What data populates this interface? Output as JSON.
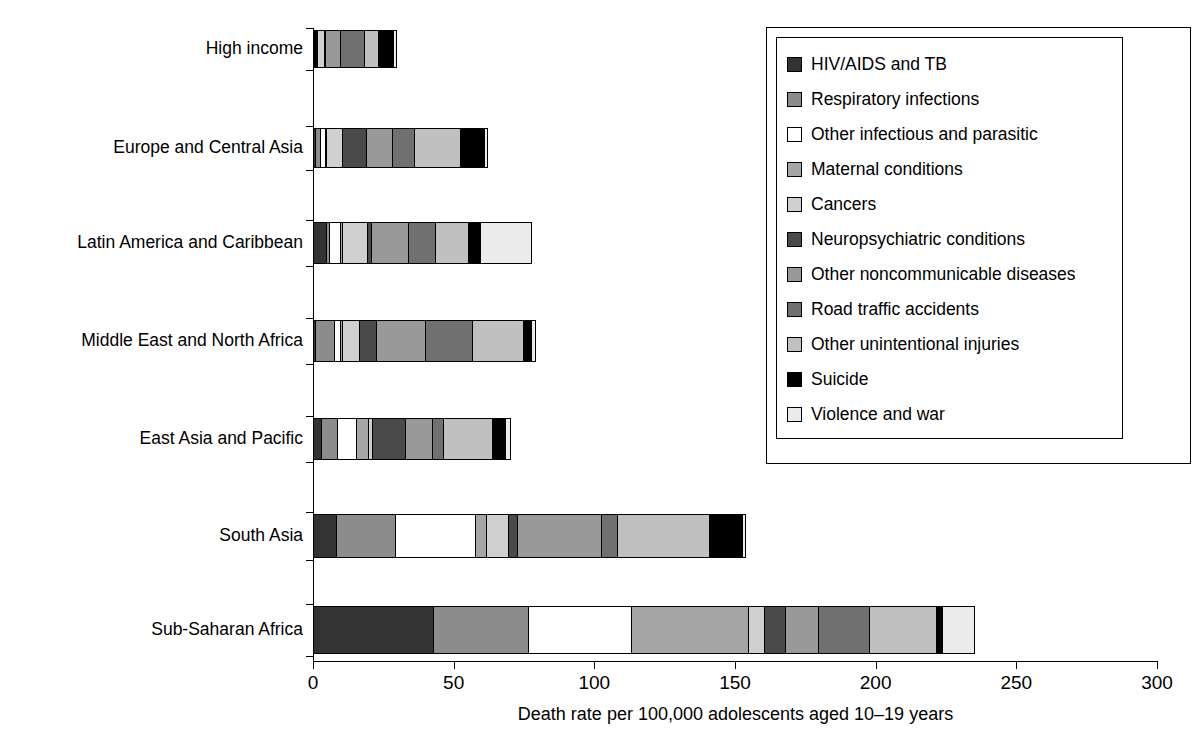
{
  "chart_data": {
    "type": "bar",
    "orientation": "horizontal",
    "stacked": true,
    "title": "",
    "xlabel": "Death rate per 100,000 adolescents aged 10–19 years",
    "ylabel": "",
    "xlim": [
      0,
      300
    ],
    "xticks": [
      0,
      50,
      100,
      150,
      200,
      250,
      300
    ],
    "xtick_labels": [
      "0",
      "50",
      "100",
      "150",
      "200",
      "250",
      "300"
    ],
    "grid": false,
    "legend_position": "top-right",
    "categories": [
      "High income",
      "Europe and Central Asia",
      "Latin America and Caribbean",
      "Middle East and North Africa",
      "East Asia and Pacific",
      "South Asia",
      "Sub-Saharan Africa"
    ],
    "series": [
      {
        "name": "HIV/AIDS and TB",
        "color": "#333333",
        "values": [
          0.6,
          1.2,
          4.8,
          1.2,
          3.2,
          8.5,
          43.0
        ]
      },
      {
        "name": "Respiratory infections",
        "color": "#8c8c8c",
        "values": [
          0.5,
          2.0,
          1.5,
          7.0,
          6.2,
          21.5,
          34.0
        ]
      },
      {
        "name": "Other infectious and parasitic",
        "color": "#ffffff",
        "values": [
          0.5,
          2.0,
          4.5,
          2.5,
          7.0,
          28.5,
          37.0
        ]
      },
      {
        "name": "Maternal conditions",
        "color": "#a6a6a6",
        "values": [
          0.2,
          0.7,
          1.0,
          1.0,
          4.5,
          4.5,
          42.0
        ]
      },
      {
        "name": "Cancers",
        "color": "#d0d0d0",
        "values": [
          2.8,
          6.0,
          9.0,
          6.5,
          2.0,
          8.0,
          6.0
        ]
      },
      {
        "name": "Neuropsychiatric conditions",
        "color": "#4a4a4a",
        "values": [
          0.8,
          9.0,
          2.0,
          6.5,
          12.0,
          3.5,
          8.0
        ]
      },
      {
        "name": "Other noncommunicable diseases",
        "color": "#999999",
        "values": [
          5.5,
          9.5,
          13.5,
          17.5,
          10.0,
          30.5,
          12.0
        ]
      },
      {
        "name": "Road traffic accidents",
        "color": "#707070",
        "values": [
          9.0,
          8.5,
          10.0,
          17.0,
          4.0,
          6.0,
          18.5
        ]
      },
      {
        "name": "Other unintentional injuries",
        "color": "#c0c0c0",
        "values": [
          5.5,
          16.5,
          12.0,
          18.5,
          18.0,
          33.0,
          24.0
        ]
      },
      {
        "name": "Suicide",
        "color": "#000000",
        "values": [
          5.5,
          9.0,
          4.5,
          3.5,
          5.0,
          12.0,
          2.5
        ]
      },
      {
        "name": "Violence and war",
        "color": "#ebebeb",
        "values": [
          1.5,
          1.5,
          18.5,
          1.5,
          2.0,
          1.5,
          12.0
        ]
      }
    ],
    "totals": [
      32.4,
      65.9,
      81.3,
      82.7,
      73.9,
      157.5,
      239.0
    ]
  },
  "legend": {
    "items": [
      {
        "label": "HIV/AIDS and TB",
        "color": "#333333"
      },
      {
        "label": "Respiratory infections",
        "color": "#8c8c8c"
      },
      {
        "label": "Other infectious and parasitic",
        "color": "#ffffff"
      },
      {
        "label": "Maternal conditions",
        "color": "#a6a6a6"
      },
      {
        "label": "Cancers",
        "color": "#d0d0d0"
      },
      {
        "label": "Neuropsychiatric conditions",
        "color": "#4a4a4a"
      },
      {
        "label": "Other noncommunicable diseases",
        "color": "#999999"
      },
      {
        "label": "Road traffic accidents",
        "color": "#707070"
      },
      {
        "label": "Other unintentional injuries",
        "color": "#c0c0c0"
      },
      {
        "label": "Suicide",
        "color": "#000000"
      },
      {
        "label": "Violence and war",
        "color": "#ebebeb"
      }
    ]
  }
}
